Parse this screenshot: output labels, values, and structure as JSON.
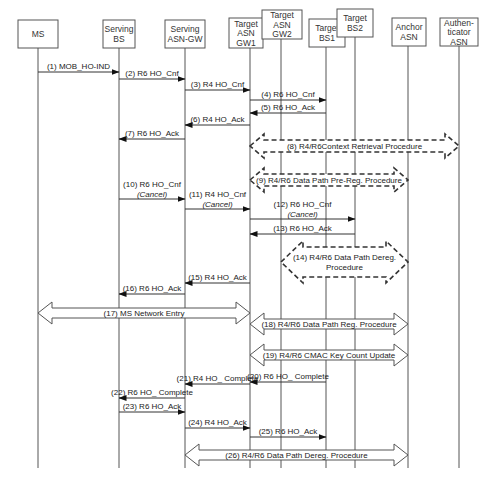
{
  "diagram": {
    "type": "sequence-diagram",
    "entities": [
      {
        "id": "ms",
        "lines": [
          "MS"
        ],
        "x": 38,
        "box": [
          18,
          20,
          40,
          28
        ]
      },
      {
        "id": "serving_bs",
        "lines": [
          "Serving",
          "BS"
        ],
        "x": 119,
        "box": [
          103,
          20,
          32,
          28
        ]
      },
      {
        "id": "serving_asn_gw",
        "lines": [
          "Serving",
          "ASN-GW"
        ],
        "x": 185,
        "box": [
          165,
          20,
          40,
          28
        ]
      },
      {
        "id": "target_asn_gw1",
        "lines": [
          "Target",
          "ASN",
          "GW1"
        ],
        "x": 250,
        "box": [
          229,
          18,
          34,
          30
        ]
      },
      {
        "id": "target_asn_gw2",
        "lines": [
          "Target",
          "ASN",
          "GW2"
        ],
        "x": 281,
        "box": [
          262,
          10,
          40,
          29
        ]
      },
      {
        "id": "target_bs1",
        "lines": [
          "Target",
          "BS1"
        ],
        "x": 326,
        "box": [
          309,
          19,
          36,
          28
        ]
      },
      {
        "id": "target_bs2",
        "lines": [
          "Target",
          "BS2"
        ],
        "x": 355,
        "box": [
          337,
          9,
          36,
          28
        ]
      },
      {
        "id": "anchor_asn",
        "lines": [
          "Anchor",
          "ASN"
        ],
        "x": 408,
        "box": [
          392,
          18,
          34,
          28
        ]
      },
      {
        "id": "authenticator_asn",
        "lines": [
          "Authen-",
          "ticator",
          "ASN"
        ],
        "x": 459,
        "box": [
          440,
          18,
          38,
          28
        ]
      }
    ],
    "lifeline_end_y": 468,
    "messages": [
      {
        "n": "1",
        "label": "(1) MOB_HO-IND",
        "from": "ms",
        "to": "serving_bs",
        "y": 72
      },
      {
        "n": "2",
        "label": "(2) R6 HO_Cnf",
        "from": "serving_bs",
        "to": "serving_asn_gw",
        "y": 79
      },
      {
        "n": "3",
        "label": "(3) R4 HO_Cnf",
        "from": "serving_asn_gw",
        "to": "target_asn_gw1",
        "y": 90
      },
      {
        "n": "4",
        "label": "(4) R6 HO_Cnf",
        "from": "target_asn_gw1",
        "to": "target_bs1",
        "y": 100
      },
      {
        "n": "5",
        "label": "(5) R6 HO_Ack",
        "from": "target_bs1",
        "to": "target_asn_gw1",
        "y": 113
      },
      {
        "n": "6",
        "label": "(6) R4 HO_Ack",
        "from": "target_asn_gw1",
        "to": "serving_asn_gw",
        "y": 125
      },
      {
        "n": "7",
        "label": "(7) R6 HO_Ack",
        "from": "serving_asn_gw",
        "to": "serving_bs",
        "y": 139
      },
      {
        "n": "10",
        "label": "(10) R6 HO_Cnf",
        "sub": "(Cancel)",
        "from": "serving_bs",
        "to": "serving_asn_gw",
        "y": 199
      },
      {
        "n": "11",
        "label": "(11) R4 HO_Cnf",
        "sub": "(Cancel)",
        "from": "serving_asn_gw",
        "to": "target_asn_gw1",
        "y": 209
      },
      {
        "n": "12",
        "label": "(12) R6 HO_Cnf",
        "sub": "(Cancel)",
        "from": "target_asn_gw1",
        "to": "target_bs2",
        "y": 219
      },
      {
        "n": "13",
        "label": "(13) R6 HO_Ack",
        "from": "target_bs2",
        "to": "target_asn_gw1",
        "y": 234
      },
      {
        "n": "15",
        "label": "(15) R4 HO_Ack",
        "from": "target_asn_gw1",
        "to": "serving_asn_gw",
        "y": 283
      },
      {
        "n": "16",
        "label": "(16) R6 HO_Ack",
        "from": "serving_asn_gw",
        "to": "serving_bs",
        "y": 294
      },
      {
        "n": "20",
        "label": "(20) R6 HO_ Complete",
        "from": "target_bs1",
        "to": "target_asn_gw1",
        "y": 382
      },
      {
        "n": "21",
        "label": "(21) R4 HO_ Complete",
        "from": "target_asn_gw1",
        "to": "serving_asn_gw",
        "y": 384
      },
      {
        "n": "22",
        "label": "(22) R6 HO_ Complete",
        "from": "serving_asn_gw",
        "to": "serving_bs",
        "y": 398
      },
      {
        "n": "23",
        "label": "(23) R6 HO_Ack",
        "from": "serving_bs",
        "to": "serving_asn_gw",
        "y": 412
      },
      {
        "n": "24",
        "label": "(24) R4 HO_Ack",
        "from": "serving_asn_gw",
        "to": "target_asn_gw1",
        "y": 428
      },
      {
        "n": "25",
        "label": "(25) R6 HO_Ack",
        "from": "target_asn_gw1",
        "to": "target_bs1",
        "y": 437
      }
    ],
    "procedures": [
      {
        "n": "8",
        "label": "(8) R4/R6Context Retrieval Procedure",
        "x1": 250,
        "x2": 459,
        "y": 146,
        "style": "dashed"
      },
      {
        "n": "9",
        "label": "(9) R4/R6 Data Path Pre-Reg. Procedure",
        "x1": 250,
        "x2": 408,
        "y": 180,
        "style": "dashed"
      },
      {
        "n": "14",
        "label": "(14) R4/R6 Data Path Dereg.",
        "label2": "Procedure",
        "x1": 281,
        "x2": 408,
        "y": 262,
        "style": "dashed-tall"
      },
      {
        "n": "17",
        "label": "(17) MS Network Entry",
        "x1": 38,
        "x2": 250,
        "y": 313,
        "style": "solid"
      },
      {
        "n": "18",
        "label": "(18) R4/R6 Data Path Reg. Procedure",
        "x1": 250,
        "x2": 408,
        "y": 324,
        "style": "solid"
      },
      {
        "n": "19",
        "label": "(19) R4/R6 CMAC Key Count Update",
        "x1": 250,
        "x2": 408,
        "y": 355,
        "style": "solid"
      },
      {
        "n": "26",
        "label": "(26) R4/R6 Data Path Dereg. Procedure",
        "x1": 185,
        "x2": 408,
        "y": 455,
        "style": "solid"
      }
    ]
  }
}
